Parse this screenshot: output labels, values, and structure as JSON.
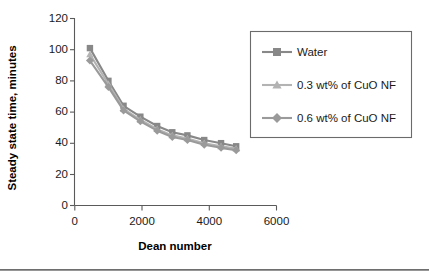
{
  "chart_data": {
    "type": "line",
    "title": "",
    "xlabel": "Dean number",
    "ylabel": "Steady state time, minutes",
    "xlim": [
      0,
      6000
    ],
    "ylim": [
      0,
      120
    ],
    "xticks": [
      0,
      2000,
      4000,
      6000
    ],
    "yticks": [
      0,
      20,
      40,
      60,
      80,
      100,
      120
    ],
    "grid": false,
    "legend_position": "right",
    "x": [
      450,
      1000,
      1450,
      1950,
      2450,
      2900,
      3350,
      3850,
      4350,
      4800
    ],
    "series": [
      {
        "name": "Water",
        "marker": "square",
        "color": "#888888",
        "x": [
          450,
          1000,
          1450,
          1950,
          2450,
          2900,
          3350,
          3850,
          4350,
          4800
        ],
        "values": [
          101,
          80,
          64,
          57,
          51,
          47,
          45,
          42,
          40,
          38
        ]
      },
      {
        "name": "0.3 wt% of CuO NF",
        "marker": "triangle",
        "color": "#b3b3b3",
        "x": [
          450,
          1000,
          1450,
          1950,
          2450,
          2900,
          3350,
          3850,
          4350,
          4800
        ],
        "values": [
          97,
          78,
          62,
          55,
          49,
          45,
          43,
          40,
          38,
          36.5
        ]
      },
      {
        "name": "0.6 wt% of CuO NF",
        "marker": "diamond",
        "color": "#9a9a9a",
        "x": [
          450,
          1000,
          1450,
          1950,
          2450,
          2900,
          3350,
          3850,
          4350,
          4800
        ],
        "values": [
          93,
          76,
          61,
          54,
          48,
          44,
          42,
          39,
          37,
          35.5
        ]
      }
    ]
  },
  "axes": {
    "y_title": "Steady state time, minutes",
    "x_title": "Dean number",
    "y_tick_labels": [
      "120",
      "100",
      "80",
      "60",
      "40",
      "20",
      "0"
    ],
    "x_tick_labels": [
      "0",
      "2000",
      "4000",
      "6000"
    ]
  },
  "legend": {
    "entries": [
      {
        "label": "Water"
      },
      {
        "label": "0.3 wt% of CuO NF"
      },
      {
        "label": "0.6 wt% of CuO NF"
      }
    ]
  },
  "colors": {
    "series_water": "#888888",
    "series_03": "#b3b3b3",
    "series_06": "#9a9a9a",
    "axis": "#5a5a5a",
    "text": "#1a1a1a"
  }
}
